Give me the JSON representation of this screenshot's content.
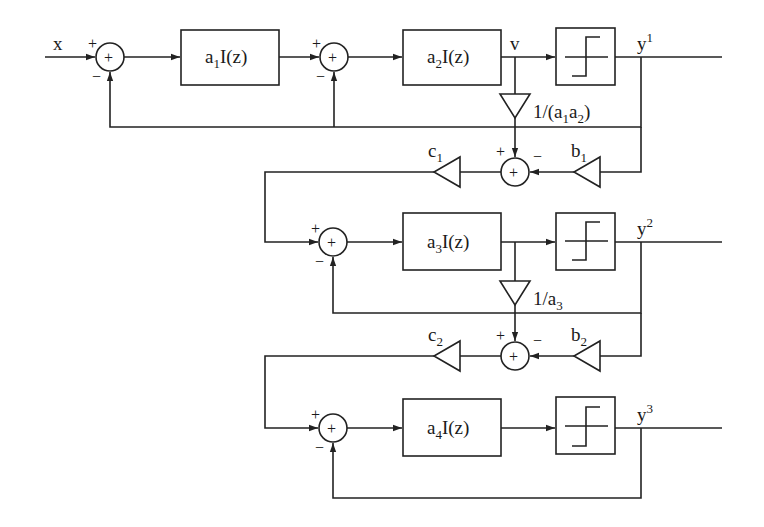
{
  "diagram": {
    "type": "block-diagram",
    "input_label": "x",
    "node_label_v": "v",
    "stages": [
      {
        "id": "stage1",
        "integrators": [
          {
            "coef": "a",
            "sub": "1",
            "rest": "I(z)"
          },
          {
            "coef": "a",
            "sub": "2",
            "rest": "I(z)"
          }
        ],
        "quantizer": "one-bit quantizer",
        "output": {
          "base": "y",
          "sup": "1"
        },
        "sum_signs": [
          "+",
          "−"
        ]
      },
      {
        "id": "stage2",
        "integrators": [
          {
            "coef": "a",
            "sub": "3",
            "rest": "I(z)"
          }
        ],
        "quantizer": "one-bit quantizer",
        "output": {
          "base": "y",
          "sup": "2"
        },
        "sum_signs": [
          "+",
          "−"
        ]
      },
      {
        "id": "stage3",
        "integrators": [
          {
            "coef": "a",
            "sub": "4",
            "rest": "I(z)"
          }
        ],
        "quantizer": "one-bit quantizer",
        "output": {
          "base": "y",
          "sup": "3"
        },
        "sum_signs": [
          "+",
          "−"
        ]
      }
    ],
    "interstage": [
      {
        "scale_gain": {
          "text_pre": "1/(a",
          "sub1": "1",
          "mid": "a",
          "sub2": "2",
          "post": ")"
        },
        "b_gain": {
          "base": "b",
          "sub": "1"
        },
        "c_gain": {
          "base": "c",
          "sub": "1"
        },
        "sum_signs": [
          "+",
          "−"
        ]
      },
      {
        "scale_gain": {
          "text_pre": "1/a",
          "sub1": "3"
        },
        "b_gain": {
          "base": "b",
          "sub": "2"
        },
        "c_gain": {
          "base": "c",
          "sub": "2"
        },
        "sum_signs": [
          "+",
          "−"
        ]
      }
    ],
    "sum_symbol": "+",
    "colors": {
      "line": "#222222",
      "background": "#ffffff"
    }
  }
}
